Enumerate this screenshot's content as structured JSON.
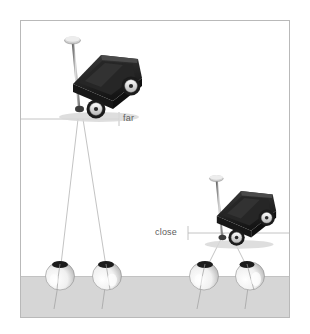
{
  "figure": {
    "background_color": "#ffffff",
    "frame_color": "#b9b9b9",
    "ground_color": "#d6d6d6",
    "sightline_color": "#a9a9a9",
    "reference_line_color": "#b5b5b5",
    "wagon_body_color": "#2b2b2b",
    "wagon_shadow_color": "#1a1a1a",
    "wagon_handle_color": "#9a9a9a",
    "wheel_rim_color": "#e8e8e8",
    "pupil_color": "#1c1c1c",
    "eyeball_color": "#f2f2f2"
  },
  "labels": {
    "far": "far",
    "close": "close"
  },
  "objects": {
    "far_wagon": {
      "name": "toy wagon",
      "distance_label": "far",
      "wheels": 2,
      "has_handle": true
    },
    "close_wagon": {
      "name": "toy wagon",
      "distance_label": "close",
      "wheels": 2,
      "has_handle": true
    }
  },
  "observers": {
    "far_pair": {
      "eye_count": 2,
      "target": "far"
    },
    "close_pair": {
      "eye_count": 2,
      "target": "close"
    }
  },
  "reference_lines": {
    "far": {
      "label": "far",
      "tick": true
    },
    "close": {
      "label": "close",
      "tick": true
    }
  }
}
